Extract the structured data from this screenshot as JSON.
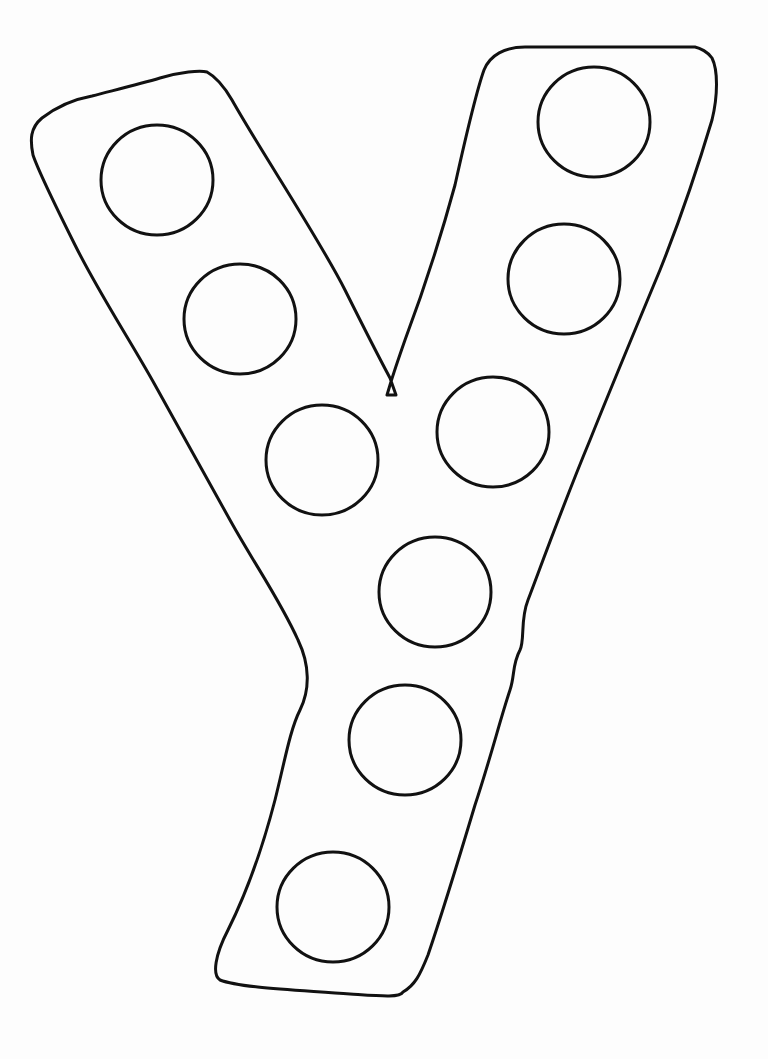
{
  "worksheet": {
    "letter": "Y",
    "stroke_color": "#111111",
    "background_color": "#fdfdfd",
    "dots": [
      {
        "cx": 157,
        "cy": 180,
        "rx": 56,
        "ry": 55
      },
      {
        "cx": 240,
        "cy": 319,
        "rx": 56,
        "ry": 55
      },
      {
        "cx": 322,
        "cy": 460,
        "rx": 56,
        "ry": 55
      },
      {
        "cx": 594,
        "cy": 122,
        "rx": 56,
        "ry": 55
      },
      {
        "cx": 564,
        "cy": 279,
        "rx": 56,
        "ry": 55
      },
      {
        "cx": 493,
        "cy": 432,
        "rx": 56,
        "ry": 55
      },
      {
        "cx": 435,
        "cy": 592,
        "rx": 56,
        "ry": 55
      },
      {
        "cx": 405,
        "cy": 740,
        "rx": 56,
        "ry": 55
      },
      {
        "cx": 333,
        "cy": 907,
        "rx": 56,
        "ry": 55
      }
    ]
  }
}
